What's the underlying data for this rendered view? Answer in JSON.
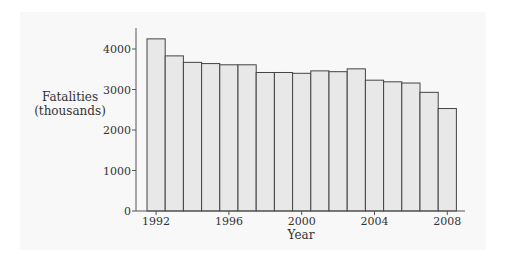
{
  "chart_data": {
    "type": "bar",
    "title": "",
    "xlabel": "Year",
    "ylabel": "Fatalities (thousands)",
    "ylabel_lines": [
      "Fatalities",
      "(thousands)"
    ],
    "categories": [
      "1992",
      "1993",
      "1994",
      "1995",
      "1996",
      "1997",
      "1998",
      "1999",
      "2000",
      "2001",
      "2002",
      "2003",
      "2004",
      "2005",
      "2006",
      "2007",
      "2008"
    ],
    "values": [
      4250,
      3830,
      3670,
      3640,
      3610,
      3610,
      3420,
      3420,
      3400,
      3460,
      3440,
      3510,
      3230,
      3190,
      3160,
      2930,
      2530
    ],
    "ylim": [
      0,
      4500
    ],
    "yticks": [
      0,
      1000,
      2000,
      3000,
      4000
    ],
    "xticks": [
      "1992",
      "1996",
      "2000",
      "2004",
      "2008"
    ],
    "grid": false,
    "legend": null,
    "bar_fill": "#e8e8e8",
    "bar_stroke": "#444444"
  }
}
